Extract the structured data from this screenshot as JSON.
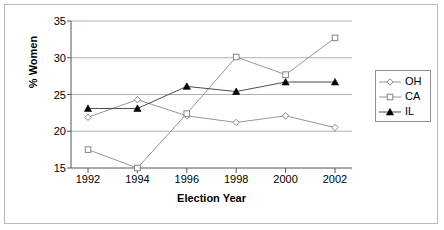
{
  "chart_data": {
    "type": "line",
    "title": "",
    "xlabel": "Election Year",
    "ylabel": "% Women",
    "categories": [
      "1992",
      "1994",
      "1996",
      "1998",
      "2000",
      "2002"
    ],
    "x": [
      1992,
      1994,
      1996,
      1998,
      2000,
      2002
    ],
    "xlim": [
      1991,
      2003
    ],
    "ylim": [
      15,
      35
    ],
    "yticks": [
      15,
      20,
      25,
      30,
      35
    ],
    "ytick_labels": [
      "15",
      "20",
      "25",
      "30",
      "35"
    ],
    "grid": "horizontal",
    "legend_position": "right",
    "series": [
      {
        "name": "OH",
        "marker": "diamond-open",
        "color": "#808080",
        "values": [
          21.9,
          24.3,
          22.1,
          21.2,
          22.1,
          20.5
        ]
      },
      {
        "name": "CA",
        "marker": "square-open",
        "color": "#808080",
        "values": [
          17.5,
          15.0,
          22.4,
          30.1,
          27.7,
          32.7
        ]
      },
      {
        "name": "IL",
        "marker": "triangle-filled",
        "color": "#000000",
        "values": [
          23.1,
          23.1,
          26.1,
          25.4,
          26.7,
          26.7
        ]
      }
    ]
  },
  "axes": {
    "y_title": "% Women",
    "x_title": "Election Year"
  },
  "legend": {
    "entries": [
      {
        "label": "OH"
      },
      {
        "label": "CA"
      },
      {
        "label": "IL"
      }
    ]
  }
}
